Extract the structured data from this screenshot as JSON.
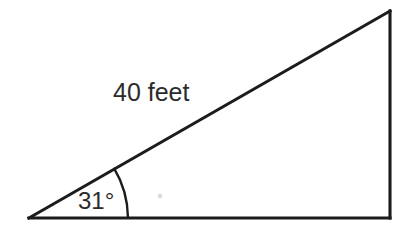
{
  "figure": {
    "type": "geometry-diagram",
    "shape": "right-triangle",
    "background_color": "#ffffff",
    "stroke_color": "#1c1c1c",
    "text_color": "#2b2b2b"
  },
  "labels": {
    "hypotenuse_length": "40 feet",
    "base_angle": "31°"
  },
  "geometry": {
    "vertices": {
      "left_vertex": {
        "x": 29,
        "y": 218
      },
      "top_right_vertex": {
        "x": 390,
        "y": 11
      },
      "bottom_right_vertex": {
        "x": 390,
        "y": 218
      }
    },
    "edges": {
      "hypotenuse": "M29,218 L390,11",
      "vertical_leg": "M390,11 L390,218",
      "base_leg": "M390,218 L29,218"
    },
    "angle_arc": {
      "path": "M128,218 A99,99 0 0,0 113.86,167.98",
      "radius": 99,
      "center_x": 29,
      "center_y": 218,
      "sweep_degrees": 31
    },
    "interior_dot": {
      "cx": 160,
      "cy": 196,
      "r": 2.2
    }
  },
  "label_positions": {
    "hypotenuse_label": {
      "x": 113,
      "y": 101
    },
    "angle_label": {
      "x": 78,
      "y": 209
    }
  },
  "chart_data": {
    "type": "diagram",
    "title": "",
    "measurements": [
      {
        "name": "hypotenuse",
        "value": 40,
        "unit": "feet",
        "label": "40 feet"
      },
      {
        "name": "base-angle",
        "value": 31,
        "unit": "degrees",
        "label": "31°"
      }
    ]
  }
}
